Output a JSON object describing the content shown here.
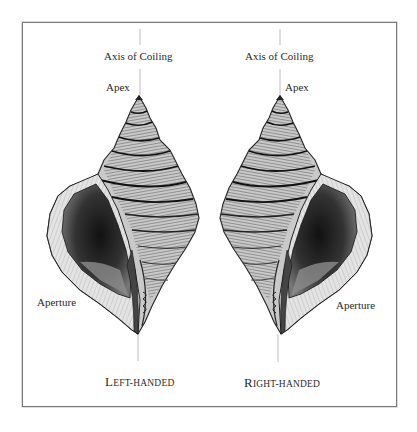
{
  "figure": {
    "left_shell": {
      "axis_label": "Axis of Coiling",
      "apex_label": "Apex",
      "aperture_label": "Aperture",
      "caption_initial": "L",
      "caption_rest": "EFT-HANDED"
    },
    "right_shell": {
      "axis_label": "Axis of Coiling",
      "apex_label": "Apex",
      "aperture_label": "Aperture",
      "caption_initial": "R",
      "caption_rest": "IGHT-HANDED"
    },
    "colors": {
      "frame": "#7a7a7a",
      "axis_line": "#bdbdbd",
      "ink": "#222222",
      "shell_mid": "#8a8a8a",
      "aperture_dark": "#1a1a1a"
    }
  }
}
